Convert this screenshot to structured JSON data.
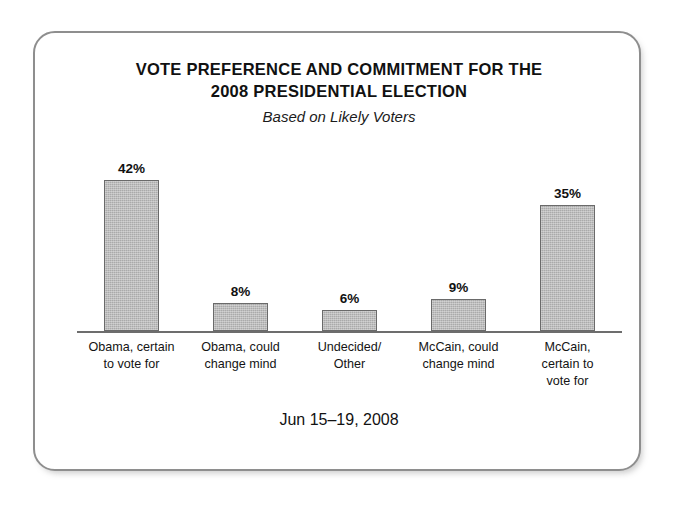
{
  "chart_data": {
    "type": "bar",
    "title": "VOTE PREFERENCE AND COMMITMENT FOR THE\n2008 PRESIDENTIAL ELECTION",
    "subtitle": "Based on Likely Voters",
    "footer": "Jun 15–19, 2008",
    "categories": [
      "Obama, certain\nto vote for",
      "Obama, could\nchange mind",
      "Undecided/\nOther",
      "McCain, could\nchange mind",
      "McCain,\ncertain to\nvote for"
    ],
    "values": [
      42,
      8,
      6,
      9,
      35
    ],
    "value_labels": [
      "42%",
      "8%",
      "6%",
      "9%",
      "35%"
    ],
    "xlabel": "",
    "ylabel": "",
    "ylim": [
      0,
      48
    ],
    "grid": false,
    "legend": false,
    "bar_color": "#aaaaaa",
    "bar_border_color": "#6a6a6a",
    "axis_color": "#6d6d6d",
    "frame_color": "#8e8e8e",
    "background": "#ffffff"
  }
}
